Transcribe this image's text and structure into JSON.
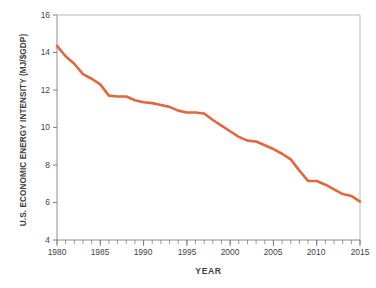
{
  "chart_data": {
    "type": "line",
    "title": "",
    "xlabel": "YEAR",
    "ylabel": "U.S. ECONOMIC ENERGY INTENSITY (MJ/$GDP)",
    "xlim": [
      1980,
      2015
    ],
    "ylim": [
      4,
      16
    ],
    "ytick_labels": [
      "16",
      "14",
      "12",
      "10",
      "8",
      "6",
      "4"
    ],
    "yticks": [
      16,
      14,
      12,
      10,
      8,
      6,
      4
    ],
    "xtick_labels": [
      "1980",
      "1985",
      "1990",
      "1995",
      "2000",
      "2005",
      "2010",
      "2015"
    ],
    "xticks": [
      1980,
      1985,
      1990,
      1995,
      2000,
      2005,
      2010,
      2015
    ],
    "minor_xtick_interval": 1,
    "grid": false,
    "legend": "none",
    "line_color": "#E2673F",
    "line_width": 2.6,
    "axis_color": "#808080",
    "background": "#ffffff",
    "series": [
      {
        "name": "U.S. economic energy intensity",
        "x": [
          1980,
          1981,
          1982,
          1983,
          1984,
          1985,
          1986,
          1987,
          1988,
          1989,
          1990,
          1991,
          1992,
          1993,
          1994,
          1995,
          1996,
          1997,
          1998,
          1999,
          2000,
          2001,
          2002,
          2003,
          2004,
          2005,
          2006,
          2007,
          2008,
          2009,
          2010,
          2011,
          2012,
          2013,
          2014,
          2015
        ],
        "values": [
          14.35,
          13.8,
          13.4,
          12.85,
          12.6,
          12.3,
          11.7,
          11.65,
          11.65,
          11.45,
          11.35,
          11.3,
          11.2,
          11.1,
          10.9,
          10.8,
          10.8,
          10.75,
          10.4,
          10.1,
          9.8,
          9.5,
          9.3,
          9.25,
          9.05,
          8.85,
          8.6,
          8.3,
          7.7,
          7.15,
          7.15,
          6.95,
          6.7,
          6.45,
          6.35,
          6.05
        ]
      }
    ]
  },
  "axes_geometry": {
    "plot_left": 57,
    "plot_right": 360,
    "plot_top": 15,
    "plot_bottom": 240
  }
}
